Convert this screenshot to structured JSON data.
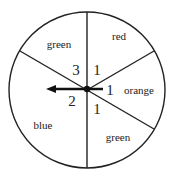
{
  "spinner": {
    "sectors": [
      {
        "name": "red",
        "label": "red",
        "number": "1"
      },
      {
        "name": "orange",
        "label": "orange",
        "number": "1"
      },
      {
        "name": "green-bottom",
        "label": "green",
        "number": "1"
      },
      {
        "name": "blue",
        "label": "blue",
        "number": "2"
      },
      {
        "name": "green-top",
        "label": "green",
        "number": "3"
      }
    ],
    "pointer_direction": "left",
    "line_color": "#222222"
  }
}
